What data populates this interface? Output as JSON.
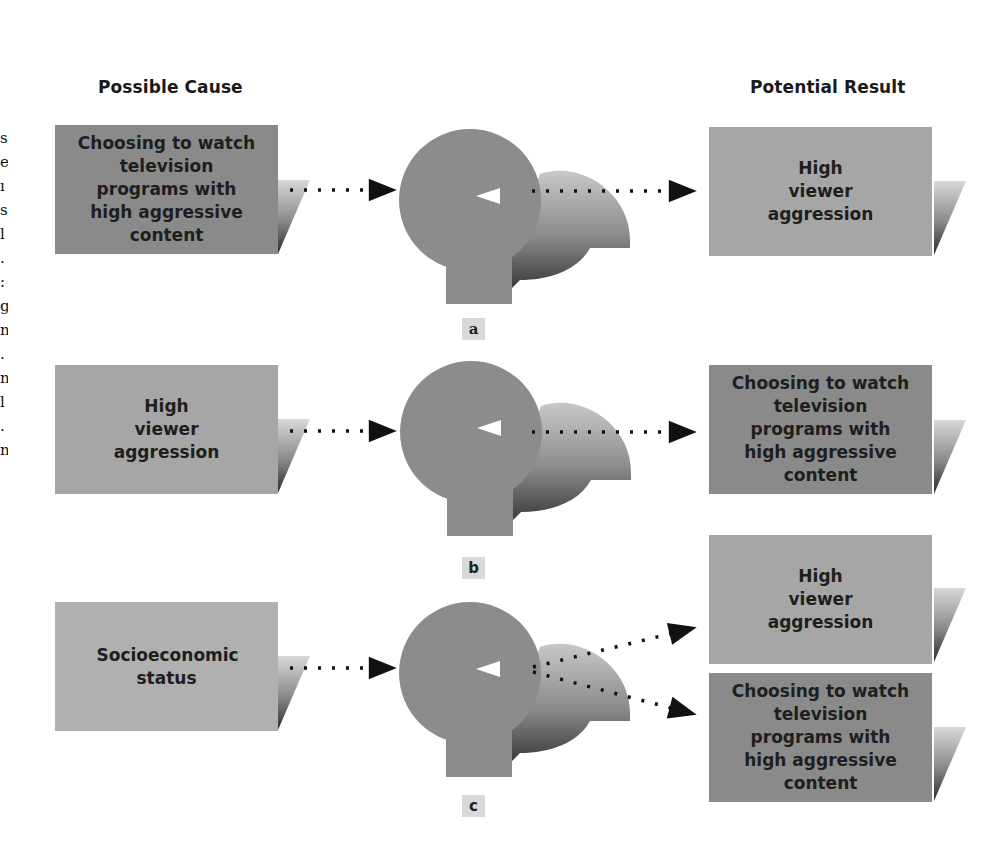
{
  "headers": {
    "cause": "Possible Cause",
    "result": "Potential Result"
  },
  "edge_fragments": [
    "s",
    "e",
    "ı",
    "s",
    "l",
    ".",
    ":",
    "g",
    "n",
    ".",
    "n",
    "l",
    ".",
    "n"
  ],
  "panels": [
    {
      "label": "a",
      "cause": "Choosing to watch television programs with high aggressive content",
      "results": [
        "High viewer aggression"
      ]
    },
    {
      "label": "b",
      "cause": "High viewer aggression",
      "results": [
        "Choosing to watch television programs with high aggressive content"
      ]
    },
    {
      "label": "c",
      "cause": "Socioeconomic status",
      "results": [
        "High viewer aggression",
        "Choosing to watch television programs with high aggressive content"
      ]
    }
  ],
  "colors": {
    "box_dark": "#8a8a8a",
    "box_light": "#a6a6a6",
    "head_fill": "#8c8c8c",
    "label_bg": "#d9d9d9",
    "arrow": "#111111"
  }
}
